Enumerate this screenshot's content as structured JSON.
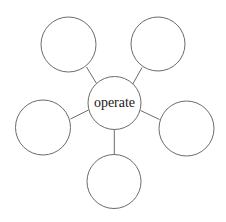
{
  "diagram": {
    "type": "word-web",
    "background_color": "#ffffff",
    "stroke_color": "#6b6b6b",
    "stroke_width": 1,
    "text_color": "#1a1a1a",
    "center_node": {
      "id": "center",
      "label": "operate",
      "cx": 114.5,
      "cy": 103,
      "r": 26.5,
      "font_size": 14
    },
    "satellite_nodes": [
      {
        "id": "node-top-left",
        "label": "",
        "cx": 68.5,
        "cy": 44.5,
        "r": 27.5
      },
      {
        "id": "node-top-right",
        "label": "",
        "cx": 158.0,
        "cy": 44.0,
        "r": 27.0
      },
      {
        "id": "node-left",
        "label": "",
        "cx": 43.0,
        "cy": 127.5,
        "r": 27.5
      },
      {
        "id": "node-right",
        "label": "",
        "cx": 186.5,
        "cy": 128.5,
        "r": 27.5
      },
      {
        "id": "node-bottom",
        "label": "",
        "cx": 114.0,
        "cy": 181.5,
        "r": 27.0
      }
    ],
    "connectors": [
      {
        "id": "edge-center-top-left",
        "from": "center",
        "to": "node-top-left",
        "x1": 96.5,
        "y1": 83.5,
        "x2": 86.5,
        "y2": 67.0
      },
      {
        "id": "edge-center-top-right",
        "from": "center",
        "to": "node-top-right",
        "x1": 132.5,
        "y1": 84.5,
        "x2": 142.0,
        "y2": 67.5
      },
      {
        "id": "edge-center-left",
        "from": "center",
        "to": "node-left",
        "x1": 88.5,
        "y1": 110.0,
        "x2": 70.5,
        "y2": 119.0
      },
      {
        "id": "edge-center-right",
        "from": "center",
        "to": "node-right",
        "x1": 140.5,
        "y1": 110.5,
        "x2": 159.5,
        "y2": 119.5
      },
      {
        "id": "edge-center-bottom",
        "from": "center",
        "to": "node-bottom",
        "x1": 114.3,
        "y1": 129.5,
        "x2": 114.3,
        "y2": 154.5
      }
    ]
  }
}
